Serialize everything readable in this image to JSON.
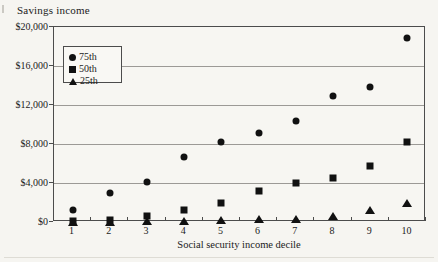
{
  "figure": {
    "title": "Savings income",
    "xlabel": "Social security income decile"
  },
  "chart_data": {
    "type": "scatter",
    "title": "Savings income",
    "xlabel": "Social security income decile",
    "ylabel": "",
    "categories": [
      "1",
      "2",
      "3",
      "4",
      "5",
      "6",
      "7",
      "8",
      "9",
      "10"
    ],
    "series": [
      {
        "name": "75th",
        "marker": "circle",
        "values": [
          1200,
          3000,
          4100,
          6700,
          8200,
          9100,
          10400,
          12900,
          13800,
          18900
        ]
      },
      {
        "name": "50th",
        "marker": "square",
        "values": [
          100,
          200,
          600,
          1200,
          1900,
          3200,
          4000,
          4500,
          5700,
          8200
        ]
      },
      {
        "name": "25th",
        "marker": "triangle",
        "values": [
          0,
          0,
          100,
          100,
          200,
          300,
          300,
          600,
          1200,
          2000
        ]
      }
    ],
    "ylim": [
      0,
      20000
    ],
    "ytick_step": 4000,
    "y_tick_labels": [
      "$0",
      "$4,000",
      "$8,000",
      "$12,000",
      "$16,000",
      "$20,000"
    ],
    "grid": true,
    "legend_position": "upper left inside",
    "legend": [
      {
        "label": "75th",
        "marker": "circle"
      },
      {
        "label": "50th",
        "marker": "square"
      },
      {
        "label": "25th",
        "marker": "triangle"
      }
    ]
  },
  "colors": {
    "background": "#f6f5f1",
    "marker": "#111111",
    "gridline": "#9c9a96",
    "axis": "#4c4c4c",
    "text": "#1b1b1b"
  }
}
